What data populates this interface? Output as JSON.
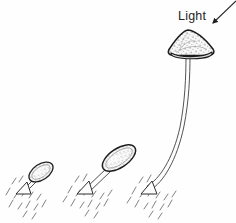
{
  "figure": {
    "background_color": "#fefefe",
    "ink_color": "#3a3a3a",
    "dark_ink_color": "#1f1f1f",
    "stipple_color": "#555555"
  },
  "annotations": {
    "light_label": "Light",
    "light_label_x": 178,
    "light_label_y": 16,
    "arrow": {
      "name": "light-direction-arrow",
      "from_x": 236,
      "from_y": 2,
      "to_x": 210,
      "to_y": 26,
      "head_filled": true
    }
  },
  "stages": [
    {
      "id": "stage-1",
      "label": "young sporangiophore",
      "cap_center_x": 41,
      "cap_center_y": 172,
      "cap_rx": 13,
      "cap_ry": 7.5,
      "cap_rotation_deg": -34,
      "stalk_base_x": 22,
      "stalk_base_y": 191,
      "stalk_tip_x": 33,
      "stalk_tip_y": 180,
      "substrate_x": 20,
      "substrate_y": 192,
      "hatch_count": 14
    },
    {
      "id": "stage-2",
      "label": "elongating sporangiophore",
      "cap_center_x": 119,
      "cap_center_y": 158,
      "cap_rx": 18,
      "cap_ry": 9,
      "cap_rotation_deg": -34,
      "stalk_base_x": 84,
      "stalk_base_y": 190,
      "stalk_tip_x": 107,
      "stalk_tip_y": 169,
      "substrate_x": 82,
      "substrate_y": 191,
      "hatch_count": 16
    },
    {
      "id": "stage-3",
      "label": "mature phototropic sporangiophore bending toward light",
      "cap_center_x": 192,
      "cap_center_y": 46,
      "cap_width": 52,
      "cap_height": 20,
      "cap_shape": "cone",
      "stalk_base_x": 148,
      "stalk_base_y": 191,
      "stalk_top_x": 190,
      "stalk_top_y": 56,
      "substrate_x": 146,
      "substrate_y": 192,
      "hatch_count": 16
    }
  ]
}
